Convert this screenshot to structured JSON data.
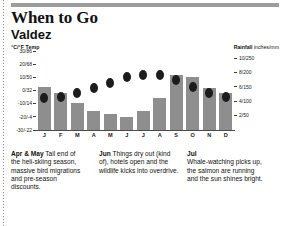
{
  "header": {
    "title": "When to Go",
    "subtitle": "Valdez",
    "top_rule_color": "#9c9c9c"
  },
  "chart_data": {
    "type": "bar",
    "subtitle": "Valdez",
    "categories": [
      "J",
      "F",
      "M",
      "A",
      "M",
      "J",
      "J",
      "A",
      "S",
      "O",
      "N",
      "D"
    ],
    "month_names": [
      "January",
      "February",
      "March",
      "April",
      "May",
      "June",
      "July",
      "August",
      "September",
      "October",
      "November",
      "December"
    ],
    "series": [
      {
        "name": "Rainfall",
        "unit": "inches/mm",
        "type": "bar",
        "color": "#8e8e8e",
        "values": [
          6.0,
          5.2,
          3.8,
          2.6,
          2.2,
          1.8,
          2.6,
          4.4,
          7.6,
          7.4,
          5.8,
          5.2
        ]
      },
      {
        "name": "Temp",
        "unit": "°C/°F",
        "type": "scatter",
        "color": "#1c1c1c",
        "values": [
          -6,
          -5,
          -2,
          2,
          6,
          10,
          12,
          12,
          8,
          3,
          -2,
          -5
        ]
      }
    ],
    "left_axis": {
      "label": "°C/°F",
      "label_bold": "Temp",
      "ticks": [
        "30/86",
        "20/68",
        "10/50",
        "0/32",
        "-10/14",
        "-20/-4",
        "-30/-22"
      ],
      "values": [
        30,
        20,
        10,
        0,
        -10,
        -20,
        -30
      ],
      "range": [
        -30,
        30
      ]
    },
    "right_axis": {
      "label_bold": "Rainfall",
      "label": "inches/mm",
      "ticks": [
        "10/250",
        "8/200",
        "6/150",
        "4/100",
        "2/50"
      ],
      "values": [
        10,
        8,
        6,
        4,
        2
      ],
      "range": [
        0,
        11
      ]
    },
    "xlabel": "",
    "grid": false,
    "legend": "none"
  },
  "axis_heads": {
    "left_unit": "°C/°F",
    "left_name": "Temp",
    "right_name": "Rainfall",
    "right_unit": "inches/mm"
  },
  "panels": [
    {
      "lead": "Apr & May",
      "text": " Tail end of the heli-skiing season, massive bird migrations and pre-season discounts."
    },
    {
      "lead": "Jun",
      "text": " Things dry out (kind of), hotels open and the wildlife kicks into overdrive."
    },
    {
      "lead": "Jul",
      "text": "Whale-watching picks up, the salmon are running and the sun shines bright.",
      "lead_on_own_line": true
    }
  ]
}
